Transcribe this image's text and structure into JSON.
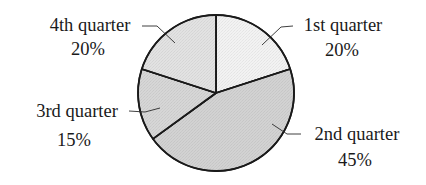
{
  "chart_data": {
    "type": "pie",
    "title": "",
    "start_angle_deg": 0,
    "direction": "clockwise",
    "slices": [
      {
        "label": "1st quarter",
        "value": 20,
        "value_label": "20%",
        "color": "#f2f2f2"
      },
      {
        "label": "2nd quarter",
        "value": 45,
        "value_label": "45%",
        "color": "#d2d2d2"
      },
      {
        "label": "3rd quarter",
        "value": 15,
        "value_label": "15%",
        "color": "#d6d6d6"
      },
      {
        "label": "4th quarter",
        "value": 20,
        "value_label": "20%",
        "color": "#e2e2e2"
      }
    ],
    "legend": "none (leader-line labels)"
  },
  "labels": {
    "q1": {
      "name": "1st quarter",
      "pct": "20%"
    },
    "q2": {
      "name": "2nd quarter",
      "pct": "45%"
    },
    "q3": {
      "name": "3rd quarter",
      "pct": "15%"
    },
    "q4": {
      "name": "4th quarter",
      "pct": "20%"
    }
  }
}
